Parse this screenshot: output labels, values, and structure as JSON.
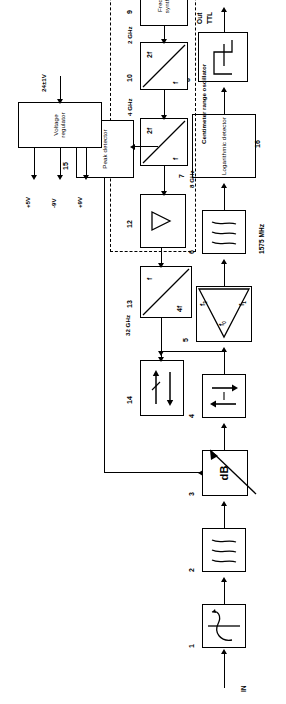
{
  "diagram": {
    "io": {
      "input_label": "IN",
      "output_label_line1": "Out",
      "output_label_line2": "TTL",
      "ctrl_label": "Ctrl",
      "supply_input_label": "24±1V"
    },
    "frequency_labels": {
      "if_chain": "1575 MHz",
      "mixer_lo": "32 GHz",
      "amp_out": "8 GHz",
      "doubler2_in": "4 GHz",
      "doubler1_in": "2 GHz"
    },
    "group_label": "Centimeter range oscillator",
    "supply_rails": [
      "+9V",
      "-9V",
      "+5V"
    ],
    "mixer_ports": {
      "f1": "f",
      "f1_sub": "1",
      "f0": "f",
      "f0_sub": "0",
      "f2": "f",
      "f2_sub": "2"
    },
    "blocks": [
      {
        "id": "1",
        "num": "1",
        "label": "",
        "icon": "circulator-icon"
      },
      {
        "id": "2",
        "num": "2",
        "label": "",
        "icon": "bandpass-filter-icon"
      },
      {
        "id": "3",
        "num": "3",
        "label": "dB",
        "icon": "variable-attenuator-icon"
      },
      {
        "id": "4",
        "num": "4",
        "label": "",
        "icon": "isolator-amplifier-icon"
      },
      {
        "id": "5",
        "num": "5",
        "label": "",
        "icon": "mixer-icon"
      },
      {
        "id": "6",
        "num": "6",
        "label": "",
        "icon": "bandpass-filter-icon"
      },
      {
        "id": "7",
        "num": "7",
        "label": "Logarithmic detector",
        "icon": ""
      },
      {
        "id": "8",
        "num": "8",
        "label": "",
        "icon": "schmitt-trigger-icon"
      },
      {
        "id": "9",
        "num": "9",
        "label": "Frequency synthesizer",
        "icon": ""
      },
      {
        "id": "10",
        "num": "10",
        "label": "",
        "icon": "frequency-doubler-icon",
        "in": "f",
        "out": "2f"
      },
      {
        "id": "11",
        "num": "11",
        "label": "",
        "icon": "frequency-doubler-icon",
        "in": "f",
        "out": "2f"
      },
      {
        "id": "12",
        "num": "12",
        "label": "",
        "icon": "amplifier-triangle-icon"
      },
      {
        "id": "13",
        "num": "13",
        "label": "",
        "icon": "frequency-multiplier-icon",
        "in": "f",
        "out": "4f"
      },
      {
        "id": "14",
        "num": "14",
        "label": "",
        "icon": "directional-coupler-icon"
      },
      {
        "id": "15",
        "num": "15",
        "label": "Peak detector",
        "icon": ""
      },
      {
        "id": "16",
        "num": "16",
        "label": "Voltage regulator",
        "icon": ""
      }
    ]
  }
}
